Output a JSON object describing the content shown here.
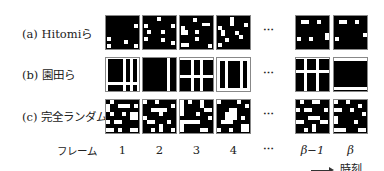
{
  "rows": [
    {
      "label": "(a) Hitomiら",
      "kind": "sparse-dots"
    },
    {
      "label": "(b) 園田ら",
      "kind": "stripes"
    },
    {
      "label": "(c) 完全ランダム",
      "kind": "random"
    }
  ],
  "axis": {
    "row_label": "フレーム",
    "frames": [
      "1",
      "2",
      "3",
      "4",
      "⋯",
      "β−1",
      "β"
    ],
    "ellipsis": "⋯",
    "time_label": "時刻"
  }
}
